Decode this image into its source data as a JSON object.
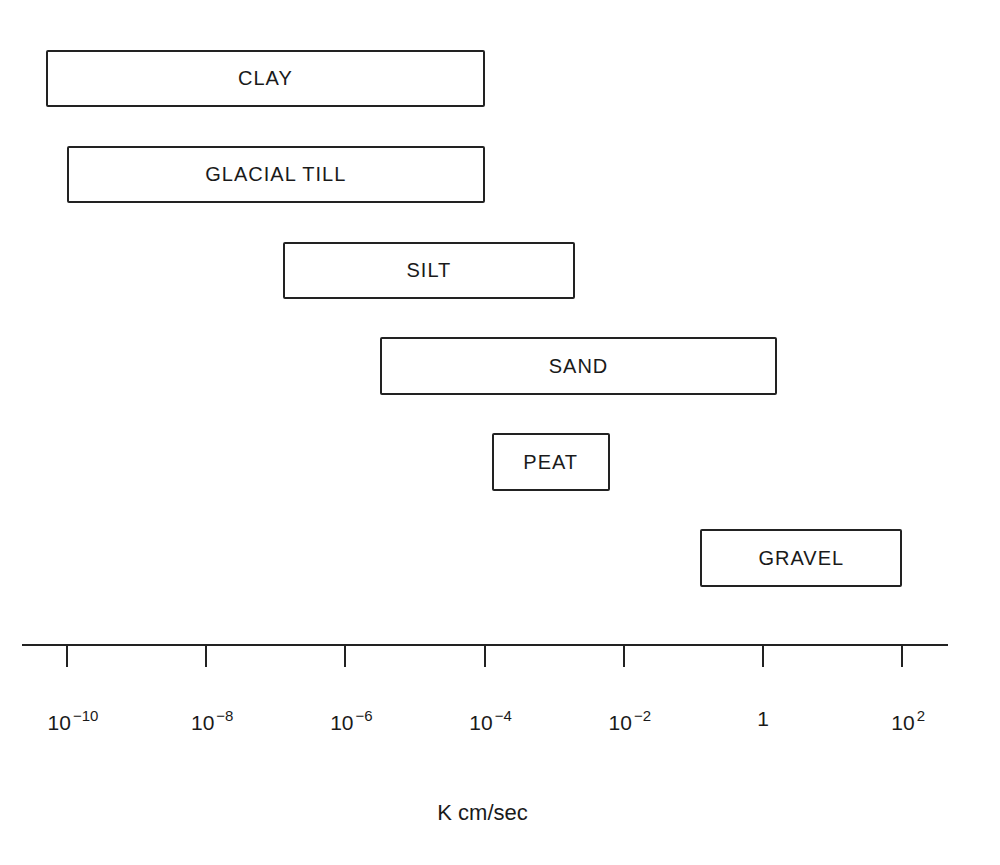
{
  "chart_data": {
    "type": "range-bar",
    "title": "",
    "xlabel": "K cm/sec",
    "ylabel": "",
    "xscale": "log10",
    "xlim_log10": [
      -10.6,
      2.7
    ],
    "grid": false,
    "legend": null,
    "categories": [
      "CLAY",
      "GLACIAL TILL",
      "SILT",
      "SAND",
      "PEAT",
      "GRAVEL"
    ],
    "ranges_log10": [
      {
        "name": "CLAY",
        "min": -10.3,
        "max": -4.0
      },
      {
        "name": "GLACIAL TILL",
        "min": -10.0,
        "max": -4.0
      },
      {
        "name": "SILT",
        "min": -6.9,
        "max": -2.7
      },
      {
        "name": "SAND",
        "min": -5.5,
        "max": 0.2
      },
      {
        "name": "PEAT",
        "min": -3.9,
        "max": -2.2
      },
      {
        "name": "GRAVEL",
        "min": -0.9,
        "max": 2.0
      }
    ],
    "x_ticks": [
      {
        "value_log10": -10,
        "base": "10",
        "exp": "−10"
      },
      {
        "value_log10": -8,
        "base": "10",
        "exp": "−8"
      },
      {
        "value_log10": -6,
        "base": "10",
        "exp": "−6"
      },
      {
        "value_log10": -4,
        "base": "10",
        "exp": "−4"
      },
      {
        "value_log10": -2,
        "base": "10",
        "exp": "−2"
      },
      {
        "value_log10": 0,
        "base": "1",
        "exp": ""
      },
      {
        "value_log10": 2,
        "base": "10",
        "exp": "2"
      }
    ]
  },
  "layout": {
    "x0_px": 67,
    "px_per_decade": 69.6,
    "boxes_px": [
      {
        "top": 50,
        "height": 57
      },
      {
        "top": 146,
        "height": 57
      },
      {
        "top": 242,
        "height": 57
      },
      {
        "top": 337,
        "height": 58
      },
      {
        "top": 433,
        "height": 58
      },
      {
        "top": 529,
        "height": 58
      }
    ]
  },
  "colors": {
    "stroke": "#222222",
    "background": "#ffffff"
  }
}
